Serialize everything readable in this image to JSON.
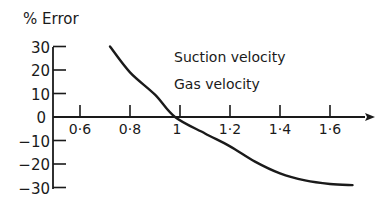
{
  "chart_data": {
    "type": "line",
    "title": "",
    "ylabel": "% Error",
    "xlabel": "",
    "xlim": [
      0.5,
      1.75
    ],
    "ylim": [
      -30,
      30
    ],
    "grid": false,
    "x_ticks": [
      "0.6",
      "0.8",
      "1",
      "1.2",
      "1.4",
      "1.6"
    ],
    "x_tick_values": [
      0.6,
      0.8,
      1.0,
      1.2,
      1.4,
      1.6
    ],
    "y_ticks": [
      "30",
      "20",
      "10",
      "0",
      "-10",
      "-20",
      "-30"
    ],
    "y_tick_values": [
      30,
      20,
      10,
      0,
      -10,
      -20,
      -30
    ],
    "annotations": [
      "Suction velocity",
      "Gas velocity"
    ],
    "series": [
      {
        "name": "% Error",
        "x": [
          0.72,
          0.8,
          0.9,
          0.98,
          1.1,
          1.2,
          1.3,
          1.4,
          1.5,
          1.6,
          1.69
        ],
        "y": [
          30,
          19,
          9.5,
          0,
          -7,
          -12.5,
          -19,
          -24,
          -27,
          -28.5,
          -29
        ]
      }
    ]
  }
}
